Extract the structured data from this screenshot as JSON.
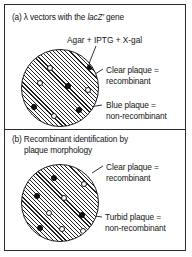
{
  "figure": {
    "background_color": "#ffffff",
    "line_color": "#1a1a1a",
    "panels": [
      {
        "id": "a",
        "title_prefix": "(a)",
        "title_text": "(a) λ vectors with the lacZ′ gene",
        "title_parts": {
          "before": "(a) λ vectors with the ",
          "italic": "lacZ′",
          "after": " gene"
        },
        "top_label": "Agar + IPTG + X-gal",
        "callouts": [
          {
            "name": "clear-plaque-callout",
            "line1": "Clear plaque =",
            "line2": "recombinant"
          },
          {
            "name": "blue-plaque-callout",
            "line1": "Blue plaque =",
            "line2": "non-recombinant"
          }
        ],
        "plate": {
          "name": "agar-plate-a",
          "hatch": "diagonal-45",
          "plaques": [
            {
              "type": "filled",
              "x": 68,
              "y": 17
            },
            {
              "type": "open",
              "x": 28,
              "y": 18
            },
            {
              "type": "open",
              "x": 18,
              "y": 33
            },
            {
              "type": "filled",
              "x": 46,
              "y": 36
            },
            {
              "type": "open",
              "x": 66,
              "y": 40
            },
            {
              "type": "filled",
              "x": 12,
              "y": 57
            },
            {
              "type": "filled",
              "x": 57,
              "y": 60
            },
            {
              "type": "open",
              "x": 32,
              "y": 66
            }
          ]
        }
      },
      {
        "id": "b",
        "title_prefix": "(b)",
        "title_text": "(b) Recombinant identification by plaque morphology",
        "title_line1": "(b) Recombinant identification by",
        "title_line2": "plaque morphology",
        "callouts": [
          {
            "name": "clear-plaque-callout",
            "line1": "Clear plaque =",
            "line2": "recombinant"
          },
          {
            "name": "turbid-plaque-callout",
            "line1": "Turbid plaque =",
            "line2": "non-recombinant"
          }
        ],
        "plate": {
          "name": "agar-plate-b",
          "hatch": "diagonal-45",
          "plaques": [
            {
              "type": "filled",
              "x": 32,
              "y": 13
            },
            {
              "type": "open",
              "x": 62,
              "y": 19
            },
            {
              "type": "filled",
              "x": 15,
              "y": 31
            },
            {
              "type": "open",
              "x": 42,
              "y": 33
            },
            {
              "type": "open",
              "x": 27,
              "y": 48
            },
            {
              "type": "filled",
              "x": 60,
              "y": 50
            },
            {
              "type": "filled",
              "x": 18,
              "y": 63
            },
            {
              "type": "open",
              "x": 40,
              "y": 64
            },
            {
              "type": "open",
              "x": 61,
              "y": 66
            }
          ]
        }
      }
    ]
  }
}
